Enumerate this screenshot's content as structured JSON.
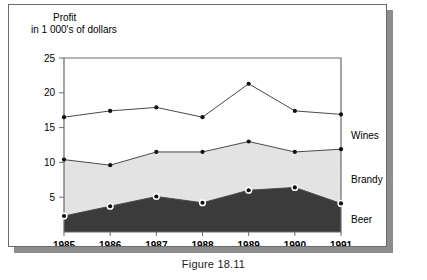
{
  "figure": {
    "caption": "Figure 18.11"
  },
  "axis_title": {
    "line1": "Profit",
    "line2": "in 1 000's of dollars"
  },
  "colors": {
    "beer_fill": "#3b3b3b",
    "brandy_fill": "#e3e3e3",
    "wines_fill": "#ffffff",
    "line": "#4a4a4a",
    "marker": "#111111",
    "marker_ring": "#ffffff",
    "frame": "#6b6b6b",
    "panel_border": "#6b6b6b",
    "shadow": "#8d8d8d"
  },
  "chart_data": {
    "type": "area",
    "title": "Profit in 1 000's of dollars",
    "xlabel": "",
    "ylabel": "Profit in 1 000's of dollars",
    "categories": [
      "1985",
      "1986",
      "1987",
      "1988",
      "1989",
      "1990",
      "1991"
    ],
    "x": [
      1985,
      1986,
      1987,
      1988,
      1989,
      1990,
      1991
    ],
    "ylim": [
      0,
      25
    ],
    "yticks": [
      5,
      10,
      15,
      20,
      25
    ],
    "ytick_labels": [
      "5",
      "10",
      "15",
      "20",
      "25"
    ],
    "stacked": true,
    "grid": false,
    "legend_position": "right-inline",
    "series": [
      {
        "name": "Beer",
        "values": [
          2.3,
          3.7,
          5.1,
          4.2,
          6.0,
          6.4,
          4.1
        ],
        "cumulative": [
          2.3,
          3.7,
          5.1,
          4.2,
          6.0,
          6.4,
          4.1
        ]
      },
      {
        "name": "Brandy",
        "values": [
          8.1,
          5.9,
          6.4,
          7.3,
          7.0,
          5.1,
          7.8
        ],
        "cumulative": [
          10.4,
          9.6,
          11.5,
          11.5,
          13.0,
          11.5,
          11.9
        ]
      },
      {
        "name": "Wines",
        "values": [
          6.1,
          7.8,
          6.4,
          5.0,
          8.3,
          5.9,
          5.0
        ],
        "cumulative": [
          16.5,
          17.4,
          17.9,
          16.5,
          21.3,
          17.4,
          16.9
        ]
      }
    ]
  }
}
